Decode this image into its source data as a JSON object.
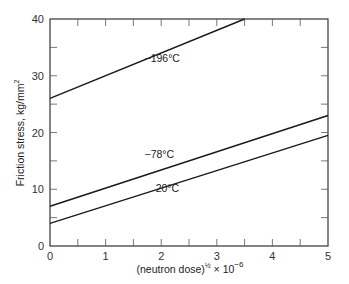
{
  "chart_data": {
    "type": "line",
    "title": "",
    "xlabel": "(neutron dose)^½ × 10^−6",
    "xlabel_parts": {
      "main": "(neutron dose)",
      "exp": "½",
      "mult": " × 10",
      "exp2": "−6"
    },
    "ylabel": "Friction stress, kg/mm²",
    "ylabel_parts": {
      "main": "Friction stress, kg/mm",
      "exp": "2"
    },
    "xlim": [
      0,
      5
    ],
    "ylim": [
      0,
      40
    ],
    "xticks": [
      0,
      1,
      2,
      3,
      4,
      5
    ],
    "xtick_labels": [
      "0",
      "1",
      "2",
      "3",
      "4",
      "5"
    ],
    "yticks": [
      0,
      10,
      20,
      30,
      40
    ],
    "ytick_labels": [
      "0",
      "10",
      "20",
      "30",
      "40"
    ],
    "grid": false,
    "legend": "inline labels",
    "series": [
      {
        "name": "−196°C",
        "x": [
          0,
          3.5
        ],
        "y": [
          26,
          40
        ],
        "label_pos": [
          1.7,
          32.5
        ]
      },
      {
        "name": "−78°C",
        "x": [
          0,
          5
        ],
        "y": [
          7,
          23
        ],
        "label_pos": [
          1.7,
          15.5
        ]
      },
      {
        "name": "20°C",
        "x": [
          0,
          5
        ],
        "y": [
          4,
          19.5
        ],
        "label_pos": [
          1.9,
          9.5
        ]
      }
    ]
  }
}
